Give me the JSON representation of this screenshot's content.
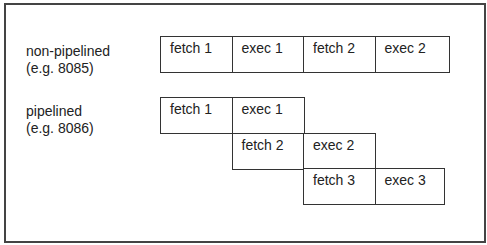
{
  "rows": [
    {
      "label": "non-pipelined",
      "sublabel": "(e.g. 8085)"
    },
    {
      "label": "pipelined",
      "sublabel": "(e.g. 8086)"
    }
  ],
  "non_pipelined_cells": [
    "fetch 1",
    "exec 1",
    "fetch 2",
    "exec 2"
  ],
  "pipelined_cells": [
    [
      "fetch 1",
      "exec 1"
    ],
    [
      "fetch 2",
      "exec 2"
    ],
    [
      "fetch 3",
      "exec 3"
    ]
  ]
}
